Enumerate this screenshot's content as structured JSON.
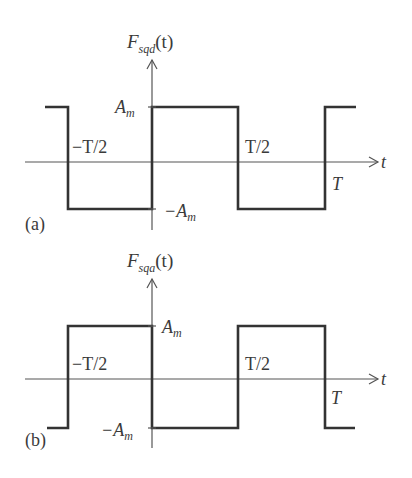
{
  "figure_a": {
    "panel_label": "(a)",
    "y_label_main": "F",
    "y_label_sub": "sqd",
    "y_label_arg": "(t)",
    "x_label": "t",
    "amp_pos_label": "A",
    "amp_neg_label": "−A",
    "amp_sub": "m",
    "tick_neg_half": "−T/2",
    "tick_pos_half": "T/2",
    "tick_period": "T",
    "description": "Square wave, odd symmetry: +A_m for 0<t<T/2, -A_m for T/2<t<T"
  },
  "figure_b": {
    "panel_label": "(b)",
    "y_label_main": "F",
    "y_label_sub": "sqa",
    "y_label_arg": "(t)",
    "x_label": "t",
    "amp_pos_label": "A",
    "amp_neg_label": "−A",
    "amp_sub": "m",
    "tick_neg_half": "−T/2",
    "tick_pos_half": "T/2",
    "tick_period": "T",
    "description": "Square wave: +A_m for -T/2<t<0, -A_m for 0<t<T/2, +A_m for T/2<t<T"
  }
}
